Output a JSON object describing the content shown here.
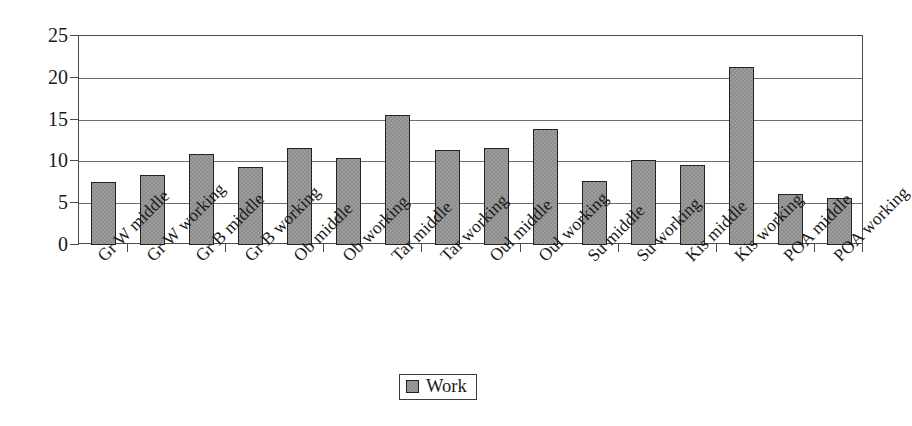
{
  "chart_data": {
    "type": "bar",
    "title": "",
    "xlabel": "",
    "ylabel": "% of observations",
    "ylim": [
      0,
      25
    ],
    "ytick_values": [
      25,
      20,
      15,
      10,
      5,
      0
    ],
    "ytick_labels": [
      "25",
      "20",
      "15",
      "10",
      "5",
      "0"
    ],
    "grid": true,
    "legend_position": "bottom-center",
    "legend": [
      "Work"
    ],
    "series_name": "Work",
    "series_color": "#8d8d8d",
    "categories": [
      "Gr W middle",
      "Gr W working",
      "Gr B middle",
      "Gr B working",
      "Ob middle",
      "Ob working",
      "Tar middle",
      "Tar working",
      "Oul middle",
      "Oul working",
      "Su middle",
      "Su working",
      "Kis middle",
      "Kis working",
      "POA middle",
      "POA working"
    ],
    "values": [
      7.5,
      8.4,
      10.9,
      9.3,
      11.6,
      10.4,
      15.5,
      11.4,
      11.6,
      13.9,
      7.7,
      10.2,
      9.6,
      21.3,
      6.1,
      5.6
    ],
    "series": [
      {
        "name": "Work",
        "values": [
          7.5,
          8.4,
          10.9,
          9.3,
          11.6,
          10.4,
          15.5,
          11.4,
          11.6,
          13.9,
          7.7,
          10.2,
          9.6,
          21.3,
          6.1,
          5.6
        ]
      }
    ]
  },
  "colors": {
    "bar_fill": "#8d8d8d",
    "bar_border": "#232323",
    "axis": "#4b4b4b",
    "grid": "#6e6e6e",
    "background": "#ffffff",
    "text": "#1a1a1a"
  }
}
